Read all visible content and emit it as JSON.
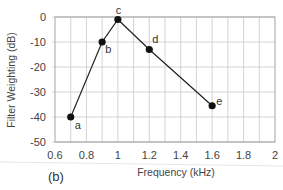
{
  "chart_data": {
    "type": "line",
    "title": "",
    "panel_label": "(b)",
    "xlabel": "Frequency (kHz)",
    "ylabel": "Filter Weighting (dB)",
    "xlim": [
      0.6,
      2
    ],
    "ylim": [
      -50,
      0
    ],
    "x_ticks": [
      0.6,
      0.8,
      1,
      1.2,
      1.4,
      1.6,
      1.8,
      2
    ],
    "x_tick_labels": [
      "0.6",
      "0.8",
      "1",
      "1.2",
      "1.4",
      "1.6",
      "1.8",
      "2"
    ],
    "y_ticks": [
      0,
      -10,
      -20,
      -30,
      -40,
      -50
    ],
    "y_tick_labels": [
      "0",
      "-10",
      "-20",
      "-30",
      "-40",
      "-50"
    ],
    "x_minor_grid_step": 0.1,
    "y_grid_step": 10,
    "grid": true,
    "legend": null,
    "series": [
      {
        "name": "Filter weighting",
        "color": "#222222",
        "marker": "circle",
        "points": [
          {
            "label": "a",
            "x": 0.7,
            "y": -40
          },
          {
            "label": "b",
            "x": 0.9,
            "y": -10
          },
          {
            "label": "c",
            "x": 1.0,
            "y": -1
          },
          {
            "label": "d",
            "x": 1.2,
            "y": -13
          },
          {
            "label": "e",
            "x": 1.6,
            "y": -35.5
          }
        ]
      }
    ]
  }
}
